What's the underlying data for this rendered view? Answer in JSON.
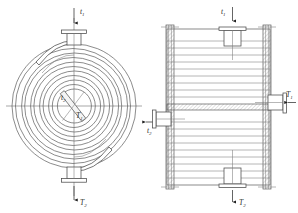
{
  "figure": {
    "background_color": "#ffffff",
    "line_color": "#5a5a5a",
    "label_color": "#2c2c2c",
    "width": 298,
    "height": 213
  },
  "views": {
    "left": {
      "name": "plan-view-spiral",
      "description": "Circular spiral coil plan view",
      "spiral_turns": 9,
      "nozzles": [
        {
          "id": "top",
          "label": "t",
          "subscript": "1",
          "direction": "down"
        },
        {
          "id": "bottom",
          "label": "T",
          "subscript": "2",
          "direction": "down"
        }
      ],
      "center_labels": [
        {
          "id": "center-upper",
          "label": "t",
          "subscript": "2"
        },
        {
          "id": "center-lower",
          "label": "T",
          "subscript": "1"
        }
      ]
    },
    "right": {
      "name": "elevation-view-shell",
      "description": "Rectangular shell elevation with stacked plates",
      "plate_rows_upper": 8,
      "plate_rows_lower": 8,
      "nozzles": [
        {
          "id": "top",
          "label": "t",
          "subscript": "1",
          "direction": "down"
        },
        {
          "id": "bottom",
          "label": "T",
          "subscript": "2",
          "direction": "down"
        },
        {
          "id": "right",
          "label": "T",
          "subscript": "1",
          "direction": "left"
        },
        {
          "id": "left",
          "label": "t",
          "subscript": "2",
          "direction": "left"
        }
      ]
    }
  },
  "labels": {
    "left_top": {
      "base": "t",
      "sub": "1"
    },
    "left_bottom": {
      "base": "T",
      "sub": "2"
    },
    "left_center_upper": {
      "base": "t",
      "sub": "2"
    },
    "left_center_lower": {
      "base": "T",
      "sub": "1"
    },
    "left_side_arrow": {
      "base": "t",
      "sub": "2"
    },
    "right_top": {
      "base": "t",
      "sub": "1"
    },
    "right_bottom": {
      "base": "T",
      "sub": "2"
    },
    "right_right": {
      "base": "T",
      "sub": "1"
    },
    "right_left": {
      "base": "t",
      "sub": "2"
    }
  }
}
